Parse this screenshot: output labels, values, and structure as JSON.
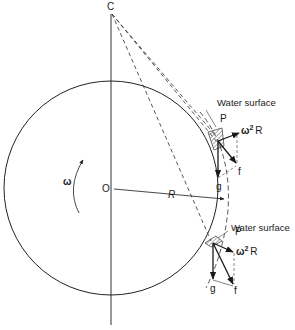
{
  "diagram": {
    "type": "physics-diagram",
    "points": {
      "C": {
        "label": "C",
        "x": 111,
        "y": 8
      },
      "O": {
        "label": "O",
        "x": 111,
        "y": 188
      },
      "P_upper": {
        "label": "P",
        "x": 218,
        "y": 140
      },
      "P_lower": {
        "label": "P",
        "x": 213,
        "y": 243
      }
    },
    "labels": {
      "center_top": "C",
      "center": "O",
      "radius": "R",
      "angular_velocity": "ω",
      "water_surface_upper": "Water surface",
      "water_surface_lower": "Water surface",
      "point_upper": "P",
      "point_lower": "P",
      "centrifugal_upper_base": "ω",
      "centrifugal_upper_sup": "2",
      "centrifugal_upper_tail": "R",
      "centrifugal_lower_base": "ω",
      "centrifugal_lower_sup": "2",
      "centrifugal_lower_tail": "R",
      "gravity_upper": "g",
      "gravity_lower": "g",
      "resultant_upper": "f",
      "resultant_lower": "f"
    },
    "colors": {
      "ink": "#1a1a1a",
      "background": "#ffffff",
      "hatch": "#555555"
    }
  }
}
